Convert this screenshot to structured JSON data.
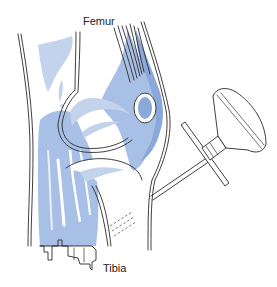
{
  "figure": {
    "labels": {
      "femur": "Femur",
      "tibia": "Tibia"
    },
    "colors": {
      "soft_tissue_light": "#c3d3ec",
      "soft_tissue_mid": "#a9c0e6",
      "soft_tissue_dark": "#8aa8da",
      "outline": "#2a2a2a",
      "background": "#ffffff"
    },
    "structures": [
      "femur",
      "tibia",
      "patella",
      "quadriceps-tendon",
      "joint-capsule",
      "skin",
      "aspiration-cup",
      "needle-shaft",
      "crossbar-handle"
    ]
  }
}
